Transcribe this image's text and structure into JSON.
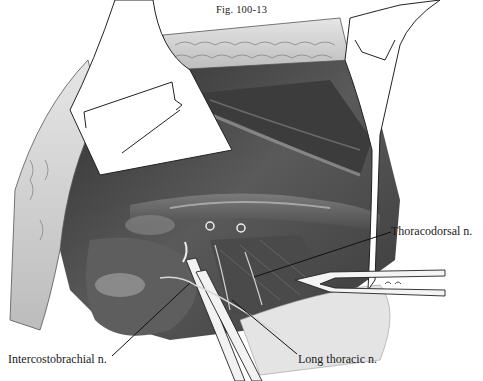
{
  "figure": {
    "title": "Fig. 100-13",
    "labels": [
      {
        "id": "thoracodorsal",
        "text": "Thoracodorsal n."
      },
      {
        "id": "intercostobrachial",
        "text": "Intercostobrachial n."
      },
      {
        "id": "long_thoracic",
        "text": "Long thoracic n."
      }
    ],
    "colors": {
      "background": "#ffffff",
      "ink": "#1a1a1a",
      "dark_tissue": "#3a3a3a",
      "mid_tissue": "#6e6e6e",
      "light_tissue": "#bdbdbd",
      "fat": "#d8d8d8"
    }
  }
}
